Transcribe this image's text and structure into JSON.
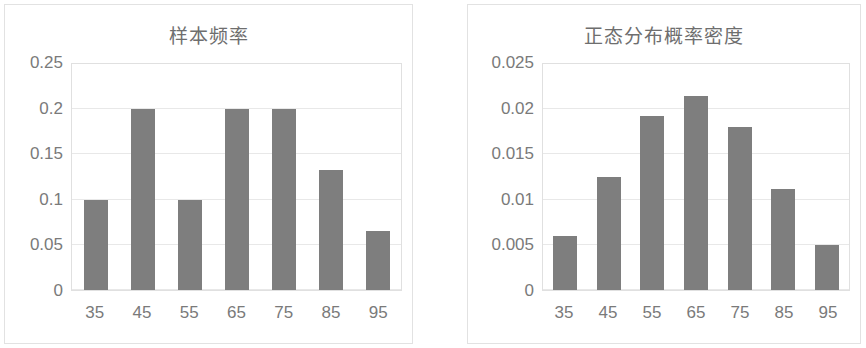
{
  "charts": [
    {
      "title": "样本频率",
      "type": "bar",
      "categories": [
        "35",
        "45",
        "55",
        "65",
        "75",
        "85",
        "95"
      ],
      "values": [
        0.1,
        0.2,
        0.1,
        0.2,
        0.2,
        0.133,
        0.065
      ],
      "yticks": [
        "0.25",
        "0.2",
        "0.15",
        "0.1",
        "0.05",
        "0"
      ],
      "ytick_values": [
        0.25,
        0.2,
        0.15,
        0.1,
        0.05,
        0
      ],
      "ylim": [
        0,
        0.25
      ],
      "xlabel": "",
      "ylabel": "",
      "grid": true,
      "legend": "none",
      "bar_color": "#7e7e7e"
    },
    {
      "title": "正态分布概率密度",
      "type": "bar",
      "categories": [
        "35",
        "45",
        "55",
        "65",
        "75",
        "85",
        "95"
      ],
      "values": [
        0.006,
        0.0125,
        0.0192,
        0.0215,
        0.018,
        0.0112,
        0.005
      ],
      "yticks": [
        "0.025",
        "0.02",
        "0.015",
        "0.01",
        "0.005",
        "0"
      ],
      "ytick_values": [
        0.025,
        0.02,
        0.015,
        0.01,
        0.005,
        0
      ],
      "ylim": [
        0,
        0.025
      ],
      "xlabel": "",
      "ylabel": "",
      "grid": true,
      "legend": "none",
      "bar_color": "#7e7e7e"
    }
  ],
  "chart_data": [
    {
      "type": "bar",
      "title": "样本频率",
      "categories": [
        "35",
        "45",
        "55",
        "65",
        "75",
        "85",
        "95"
      ],
      "values": [
        0.1,
        0.2,
        0.1,
        0.2,
        0.2,
        0.133,
        0.065
      ],
      "xlabel": "",
      "ylabel": "",
      "ylim": [
        0,
        0.25
      ],
      "ytick_values": [
        0,
        0.05,
        0.1,
        0.15,
        0.2,
        0.25
      ],
      "grid": true,
      "legend": "none"
    },
    {
      "type": "bar",
      "title": "正态分布概率密度",
      "categories": [
        "35",
        "45",
        "55",
        "65",
        "75",
        "85",
        "95"
      ],
      "values": [
        0.006,
        0.0125,
        0.0192,
        0.0215,
        0.018,
        0.0112,
        0.005
      ],
      "xlabel": "",
      "ylabel": "",
      "ylim": [
        0,
        0.025
      ],
      "ytick_values": [
        0,
        0.005,
        0.01,
        0.015,
        0.02,
        0.025
      ],
      "grid": true,
      "legend": "none"
    }
  ]
}
